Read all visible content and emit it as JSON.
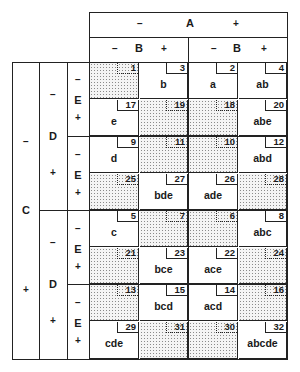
{
  "factors": {
    "A": {
      "label": "A",
      "minus": "−",
      "plus": "+"
    },
    "B": {
      "label": "B",
      "minus": "−",
      "plus": "+"
    },
    "C": {
      "label": "C",
      "minus": "−",
      "plus": "+"
    },
    "D": {
      "label": "D",
      "minus": "−",
      "plus": "+"
    },
    "E": {
      "label": "E",
      "minus": "−",
      "plus": "+"
    }
  },
  "colors": {
    "line": "#222222",
    "shade_dot": "#8a8a8a",
    "background": "#ffffff"
  },
  "rows": [
    {
      "cells": [
        {
          "n": "1",
          "t": "",
          "s": true
        },
        {
          "n": "3",
          "t": "b",
          "s": false
        },
        {
          "n": "2",
          "t": "a",
          "s": false
        },
        {
          "n": "4",
          "t": "ab",
          "s": false
        }
      ]
    },
    {
      "cells": [
        {
          "n": "17",
          "t": "e",
          "s": false
        },
        {
          "n": "19",
          "t": "",
          "s": true
        },
        {
          "n": "18",
          "t": "",
          "s": true
        },
        {
          "n": "20",
          "t": "abe",
          "s": false
        }
      ]
    },
    {
      "cells": [
        {
          "n": "9",
          "t": "d",
          "s": false
        },
        {
          "n": "11",
          "t": "",
          "s": true
        },
        {
          "n": "10",
          "t": "",
          "s": true
        },
        {
          "n": "12",
          "t": "abd",
          "s": false
        }
      ]
    },
    {
      "cells": [
        {
          "n": "25",
          "t": "",
          "s": true
        },
        {
          "n": "27",
          "t": "bde",
          "s": false
        },
        {
          "n": "26",
          "t": "ade",
          "s": false
        },
        {
          "n": "28",
          "t": "",
          "s": true
        }
      ]
    },
    {
      "cells": [
        {
          "n": "5",
          "t": "c",
          "s": false
        },
        {
          "n": "7",
          "t": "",
          "s": true
        },
        {
          "n": "6",
          "t": "",
          "s": true
        },
        {
          "n": "8",
          "t": "abc",
          "s": false
        }
      ]
    },
    {
      "cells": [
        {
          "n": "21",
          "t": "",
          "s": true
        },
        {
          "n": "23",
          "t": "bce",
          "s": false
        },
        {
          "n": "22",
          "t": "ace",
          "s": false
        },
        {
          "n": "24",
          "t": "",
          "s": true
        }
      ]
    },
    {
      "cells": [
        {
          "n": "13",
          "t": "",
          "s": true
        },
        {
          "n": "15",
          "t": "bcd",
          "s": false
        },
        {
          "n": "14",
          "t": "acd",
          "s": false
        },
        {
          "n": "16",
          "t": "",
          "s": true
        }
      ]
    },
    {
      "cells": [
        {
          "n": "29",
          "t": "cde",
          "s": false
        },
        {
          "n": "31",
          "t": "",
          "s": true
        },
        {
          "n": "30",
          "t": "",
          "s": true
        },
        {
          "n": "32",
          "t": "abcde",
          "s": false
        }
      ]
    }
  ]
}
